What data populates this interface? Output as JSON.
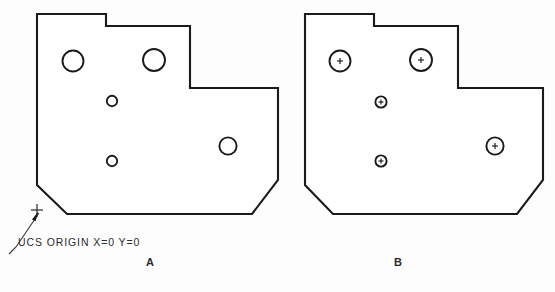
{
  "drawing": {
    "title_absent": true,
    "background_color": "#fdfdfd",
    "line_color": "#1a1a1a",
    "fill_color": "#ffffff",
    "line_width_px": 2.1
  },
  "views": [
    {
      "id": "view-a",
      "caption": "A",
      "caption_pos": {
        "x": 148,
        "y": 262
      },
      "has_center_marks": false,
      "outline_points": "37,14 106,14 106,26 190,26 190,88 278,88 278,180 252,214 67,214 37,185",
      "holes": [
        {
          "name": "hole-top-left",
          "cx": 73,
          "cy": 61,
          "r": 10.5
        },
        {
          "name": "hole-top-right",
          "cx": 154,
          "cy": 60,
          "r": 11.0
        },
        {
          "name": "hole-mid-upper",
          "cx": 112,
          "cy": 101,
          "r": 5.2
        },
        {
          "name": "hole-mid-lower",
          "cx": 112,
          "cy": 161,
          "r": 5.2
        },
        {
          "name": "hole-right",
          "cx": 228,
          "cy": 146,
          "r": 8.6
        }
      ]
    },
    {
      "id": "view-b",
      "caption": "B",
      "caption_pos": {
        "x": 396,
        "y": 262
      },
      "has_center_marks": true,
      "outline_points": "305,14 374,14 374,26 458,26 458,88 543,88 543,180 517,214 333,214 305,185",
      "holes": [
        {
          "name": "hole-top-left",
          "cx": 340,
          "cy": 61,
          "r": 10.5
        },
        {
          "name": "hole-top-right",
          "cx": 421,
          "cy": 60,
          "r": 11.0
        },
        {
          "name": "hole-mid-upper",
          "cx": 381,
          "cy": 102,
          "r": 5.6
        },
        {
          "name": "hole-mid-lower",
          "cx": 381,
          "cy": 161,
          "r": 5.6
        },
        {
          "name": "hole-right",
          "cx": 495,
          "cy": 146,
          "r": 8.6
        }
      ]
    }
  ],
  "annotation": {
    "ucs_label": "UCS  ORIGIN  X=0  Y=0",
    "ucs_label_pos": {
      "x": 16,
      "y": 243
    },
    "leader_path": "M 9,254 L 16,247 L 39,213",
    "arrow_tip": {
      "x": 39,
      "y": 212
    },
    "origin_point": {
      "x": 37,
      "y": 213
    }
  }
}
